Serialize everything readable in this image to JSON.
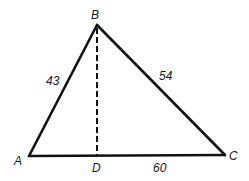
{
  "diagram": {
    "type": "triangle",
    "vertices": {
      "A": {
        "label": "A",
        "x": 29,
        "y": 156
      },
      "B": {
        "label": "B",
        "x": 97,
        "y": 25
      },
      "C": {
        "label": "C",
        "x": 225,
        "y": 155
      },
      "D": {
        "label": "D",
        "x": 97,
        "y": 156
      }
    },
    "sides": {
      "AB": {
        "label": "43"
      },
      "BC": {
        "label": "54"
      },
      "DC": {
        "label": "60"
      }
    },
    "altitude": {
      "from": "B",
      "to": "D",
      "style": "dashed"
    },
    "colors": {
      "stroke": "#111111",
      "text": "#1a1a1a",
      "background": "#ffffff"
    }
  }
}
